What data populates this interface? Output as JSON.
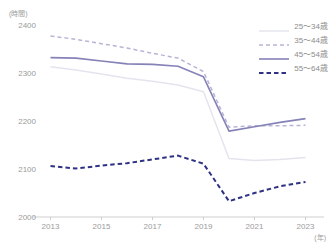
{
  "chart_data": {
    "type": "line",
    "title": "",
    "y_unit": "(時間)",
    "x_unit": "(年)",
    "xlabel": "年",
    "ylabel": "時間",
    "x": [
      2013,
      2014,
      2015,
      2016,
      2017,
      2018,
      2019,
      2020,
      2021,
      2022,
      2023
    ],
    "x_tick_years": [
      2013,
      2015,
      2017,
      2019,
      2021,
      2023
    ],
    "y_ticks": [
      2000,
      2100,
      2200,
      2300,
      2400
    ],
    "ylim": [
      2000,
      2400
    ],
    "grid": false,
    "legend_position": "top-right",
    "axis_color": "#cfcfcf",
    "text_color": "#9b9b9b",
    "series": [
      {
        "name": "25〜34歳",
        "style": "solid",
        "color": "#e4e4ee",
        "width": 1.5,
        "values": [
          2313,
          2306,
          2298,
          2289,
          2283,
          2275,
          2261,
          2122,
          2118,
          2120,
          2124
        ]
      },
      {
        "name": "35〜44歳",
        "style": "dashed",
        "color": "#b7b5d7",
        "width": 1.5,
        "values": [
          2377,
          2370,
          2361,
          2352,
          2341,
          2331,
          2303,
          2187,
          2190,
          2190,
          2191
        ]
      },
      {
        "name": "45〜54歳",
        "style": "solid",
        "color": "#8582b8",
        "width": 1.6,
        "values": [
          2332,
          2331,
          2325,
          2319,
          2318,
          2314,
          2292,
          2179,
          2188,
          2197,
          2205
        ]
      },
      {
        "name": "55〜64歳",
        "style": "dashed-bold",
        "color": "#2f3284",
        "width": 2,
        "values": [
          2106,
          2101,
          2107,
          2112,
          2120,
          2128,
          2111,
          2033,
          2050,
          2064,
          2073
        ]
      }
    ]
  }
}
